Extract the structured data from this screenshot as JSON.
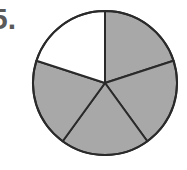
{
  "problem": {
    "number_label": "5."
  },
  "figure": {
    "type": "fraction-circle",
    "total_parts": 5,
    "shaded_parts": 4,
    "unshaded_parts": 1,
    "shaded_color": "#a8a8a8",
    "unshaded_color": "#ffffff",
    "stroke_color": "#2a2a2a"
  }
}
